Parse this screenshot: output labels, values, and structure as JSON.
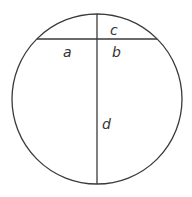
{
  "diagram": {
    "type": "circle-intersecting-chords",
    "colors": {
      "stroke": "#3a3a3a",
      "text": "#333333",
      "background": "#ffffff"
    },
    "circle": {
      "cx": 97,
      "cy": 99,
      "r": 85
    },
    "horizontal_chord": {
      "x1": 37,
      "y1": 39,
      "x2": 157,
      "y2": 39
    },
    "vertical_chord": {
      "x1": 97,
      "y1": 14,
      "x2": 97,
      "y2": 184
    },
    "labels": {
      "a": "a",
      "b": "b",
      "c": "c",
      "d": "d"
    }
  }
}
